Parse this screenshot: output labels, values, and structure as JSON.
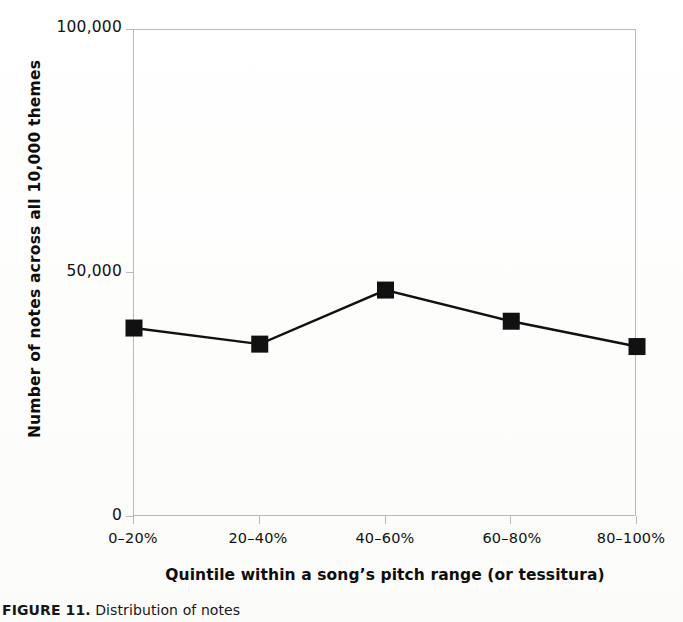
{
  "chart_data": {
    "type": "line",
    "title": "",
    "categories": [
      "0–20%",
      "20–40%",
      "40–60%",
      "60–80%",
      "80–100%"
    ],
    "values": [
      38800,
      35500,
      46600,
      40200,
      35000
    ],
    "series": [
      {
        "name": "Number of notes",
        "values": [
          38800,
          35500,
          46600,
          40200,
          35000
        ]
      }
    ],
    "xlabel": "Quintile within a song’s pitch range (or tessitura)",
    "ylabel": "Number of notes across all 10,000 themes",
    "ylim": [
      0,
      100000
    ],
    "yticks": [
      0,
      50000,
      100000
    ],
    "ytick_labels": [
      "0",
      "50,000",
      "100,000"
    ],
    "grid": false,
    "legend": false,
    "legend_position": "none",
    "marker": "filled-square",
    "line_color": "#111111",
    "marker_color": "#111111"
  },
  "axes": {
    "y_title": "Number of notes across all 10,000 themes",
    "x_title": "Quintile within a song’s pitch range (or tessitura)",
    "y_ticks": [
      {
        "value": 0,
        "label": "0"
      },
      {
        "value": 50000,
        "label": "50,000"
      },
      {
        "value": 100000,
        "label": "100,000"
      }
    ],
    "x_ticks": [
      {
        "label": "0–20%"
      },
      {
        "label": "20–40%"
      },
      {
        "label": "40–60%"
      },
      {
        "label": "60–80%"
      },
      {
        "label": "80–100%"
      }
    ]
  },
  "caption": {
    "label": "FIGURE 11.",
    "text": "Distribution of notes"
  },
  "colors": {
    "line": "#111111",
    "marker": "#111111",
    "frame": "#b9b9b9",
    "text": "#111111",
    "background": "#ffffff"
  }
}
